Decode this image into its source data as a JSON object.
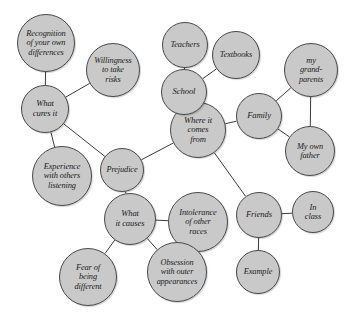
{
  "diagram": {
    "background_color": "#ffffff",
    "node_fill_color": "#c9c9c9",
    "node_stroke_color": "#4a4a4a",
    "edge_color": "#3c3c3c",
    "text_color": "#1b1b1b",
    "width": 349,
    "height": 322
  },
  "nodes": [
    {
      "id": "recognition",
      "label": "Recognition\nof your own\ndifferences",
      "cx": 46,
      "cy": 43,
      "r": 29,
      "font_size": 8.4
    },
    {
      "id": "willingness",
      "label": "Willingness\nto take\nrisks",
      "cx": 113,
      "cy": 70,
      "r": 27,
      "font_size": 8.4
    },
    {
      "id": "what-cures-it",
      "label": "What\ncures it",
      "cx": 45,
      "cy": 109,
      "r": 24,
      "font_size": 8.6
    },
    {
      "id": "experience",
      "label": "Experience\nwith others\nlistening",
      "cx": 62,
      "cy": 176,
      "r": 30,
      "font_size": 8.4
    },
    {
      "id": "prejudice",
      "label": "Prejudice",
      "cx": 122,
      "cy": 170,
      "r": 22,
      "font_size": 8.3
    },
    {
      "id": "where-from",
      "label": "Where it\ncomes\nfrom",
      "cx": 198,
      "cy": 130,
      "r": 28,
      "font_size": 8.6
    },
    {
      "id": "school",
      "label": "School",
      "cx": 184,
      "cy": 92,
      "r": 23,
      "font_size": 8.6
    },
    {
      "id": "teachers",
      "label": "Teachers",
      "cx": 185,
      "cy": 45,
      "r": 23,
      "font_size": 8.4
    },
    {
      "id": "textbooks",
      "label": "Textbooks",
      "cx": 236,
      "cy": 55,
      "r": 24,
      "font_size": 8.4
    },
    {
      "id": "family",
      "label": "Family",
      "cx": 259,
      "cy": 116,
      "r": 23,
      "font_size": 8.6
    },
    {
      "id": "grandparents",
      "label": "my\ngrand-\nparents",
      "cx": 311,
      "cy": 70,
      "r": 27,
      "font_size": 8.4
    },
    {
      "id": "own-father",
      "label": "My own\nfather",
      "cx": 310,
      "cy": 151,
      "r": 25,
      "font_size": 8.4
    },
    {
      "id": "what-causes",
      "label": "What\nit causes",
      "cx": 130,
      "cy": 219,
      "r": 26,
      "font_size": 8.6
    },
    {
      "id": "intolerance",
      "label": "Intolerance\nof other\nraces",
      "cx": 198,
      "cy": 222,
      "r": 30,
      "font_size": 8.4
    },
    {
      "id": "obsession",
      "label": "Obsession\nwith outer\nappearances",
      "cx": 177,
      "cy": 272,
      "r": 30,
      "font_size": 8.2
    },
    {
      "id": "fear",
      "label": "Fear of\nbeing\ndifferent",
      "cx": 88,
      "cy": 277,
      "r": 29,
      "font_size": 8.4
    },
    {
      "id": "friends",
      "label": "Friends",
      "cx": 259,
      "cy": 215,
      "r": 23,
      "font_size": 8.6
    },
    {
      "id": "in-class",
      "label": "In\nclass",
      "cx": 313,
      "cy": 212,
      "r": 21,
      "font_size": 8.4
    },
    {
      "id": "example",
      "label": "Example",
      "cx": 258,
      "cy": 272,
      "r": 22,
      "font_size": 8.4
    }
  ],
  "edges": [
    {
      "from": "recognition",
      "to": "what-cures-it"
    },
    {
      "from": "willingness",
      "to": "what-cures-it"
    },
    {
      "from": "what-cures-it",
      "to": "prejudice"
    },
    {
      "from": "experience",
      "to": "what-cures-it"
    },
    {
      "from": "prejudice",
      "to": "where-from"
    },
    {
      "from": "prejudice",
      "to": "what-causes"
    },
    {
      "from": "where-from",
      "to": "school"
    },
    {
      "from": "school",
      "to": "teachers"
    },
    {
      "from": "school",
      "to": "textbooks"
    },
    {
      "from": "where-from",
      "to": "family"
    },
    {
      "from": "family",
      "to": "grandparents"
    },
    {
      "from": "family",
      "to": "own-father"
    },
    {
      "from": "grandparents",
      "to": "own-father"
    },
    {
      "from": "where-from",
      "to": "friends"
    },
    {
      "from": "what-causes",
      "to": "intolerance"
    },
    {
      "from": "what-causes",
      "to": "obsession"
    },
    {
      "from": "what-causes",
      "to": "fear"
    },
    {
      "from": "friends",
      "to": "in-class"
    },
    {
      "from": "friends",
      "to": "example"
    }
  ]
}
